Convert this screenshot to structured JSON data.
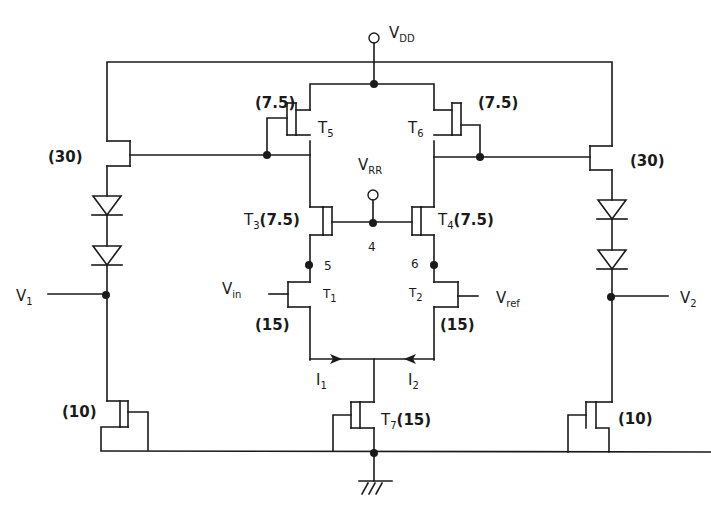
{
  "diagram": {
    "type": "cmos-comparator-schematic",
    "supply": {
      "label": "V",
      "sub": "DD"
    },
    "bias": {
      "label": "V",
      "sub": "RR"
    },
    "ground": "ground-symbol",
    "transistors": {
      "T5": {
        "name": "T",
        "sub": "5",
        "size": "(7.5)"
      },
      "T6": {
        "name": "T",
        "sub": "6",
        "size": "(7.5)"
      },
      "T3": {
        "name": "T",
        "sub": "3",
        "size": "(7.5)"
      },
      "T4": {
        "name": "T",
        "sub": "4",
        "size": "(7.5)"
      },
      "T1": {
        "name": "T",
        "sub": "1",
        "size": "(15)"
      },
      "T2": {
        "name": "T",
        "sub": "2",
        "size": "(15)"
      },
      "T7": {
        "name": "T",
        "sub": "7",
        "size": "(15)"
      },
      "left_source_follower": {
        "size": "(30)"
      },
      "right_source_follower": {
        "size": "(30)"
      },
      "left_load": {
        "size": "(10)"
      },
      "right_load": {
        "size": "(10)"
      }
    },
    "inputs": {
      "vin": {
        "label": "V",
        "sub": "in"
      },
      "vref": {
        "label": "V",
        "sub": "ref"
      }
    },
    "outputs": {
      "v1": {
        "label": "V",
        "sub": "1"
      },
      "v2": {
        "label": "V",
        "sub": "2"
      }
    },
    "nodes": {
      "n4": "4",
      "n5": "5",
      "n6": "6"
    },
    "currents": {
      "i1": {
        "label": "I",
        "sub": "1"
      },
      "i2": {
        "label": "I",
        "sub": "2"
      }
    }
  }
}
